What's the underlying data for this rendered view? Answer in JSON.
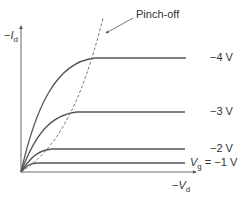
{
  "diagram": {
    "y_axis_label": {
      "prefix": "−",
      "symbol": "I",
      "subscript": "d"
    },
    "x_axis_label": {
      "prefix": "−",
      "symbol": "V",
      "subscript": "d"
    },
    "pinch_off_label": "Pinch-off",
    "curves": [
      {
        "label": "−4 V",
        "level_y": 58,
        "knee_x": 95
      },
      {
        "label": "−3 V",
        "level_y": 112,
        "knee_x": 77
      },
      {
        "label": "−2 V",
        "level_y": 149,
        "knee_x": 52
      },
      {
        "label": "= −1 V",
        "prefix_symbol": "V",
        "prefix_subscript": "g",
        "level_y": 163,
        "knee_x": 38
      }
    ],
    "colors": {
      "curve": "#555555",
      "axis": "#555555",
      "dashed": "#777777",
      "text": "#333333"
    }
  }
}
